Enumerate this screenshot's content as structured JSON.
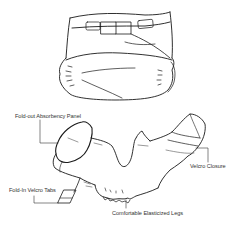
{
  "diagram": {
    "views": [
      {
        "id": "closed",
        "description": "Assembled diaper, front view"
      },
      {
        "id": "open",
        "description": "Open diaper with callouts"
      }
    ],
    "callouts": {
      "absorbency_panel": "Fold-out Absorbency Panel",
      "velcro_closure": "Velcro Closure",
      "velcro_tabs": "Fold-In Velcro Tabs",
      "elastic_legs": "Comfortable Elasticized Legs"
    },
    "colors": {
      "line": "#1a1a1a",
      "thin_line": "#555555",
      "label": "#333333",
      "background": "#ffffff"
    }
  }
}
